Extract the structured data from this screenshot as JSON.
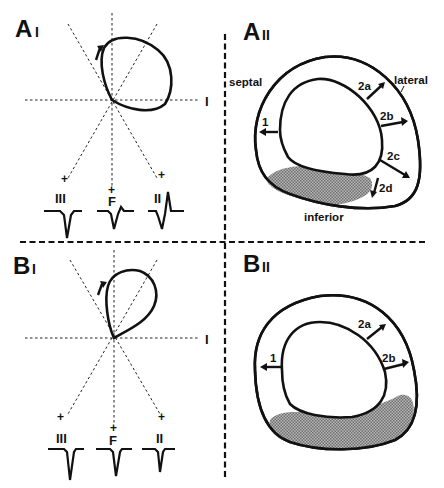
{
  "figure": {
    "panels": {
      "A1": {
        "label": "A",
        "sublabel": "I",
        "axis_label": "I",
        "leads": [
          {
            "name": "III",
            "polarity": "+",
            "waveform": "QS (deep negative)"
          },
          {
            "name": "F",
            "polarity": "+",
            "waveform": "Q with small r"
          },
          {
            "name": "II",
            "polarity": "+",
            "waveform": "Q followed by R"
          }
        ],
        "loop": "clockwise vector loop, superior-right"
      },
      "A2": {
        "label": "A",
        "sublabel": "II",
        "regions": {
          "septal": "septal",
          "lateral": "lateral",
          "inferior": "inferior"
        },
        "vectors": [
          "1",
          "2a",
          "2b",
          "2c",
          "2d"
        ]
      },
      "B1": {
        "label": "B",
        "sublabel": "I",
        "axis_label": "I",
        "leads": [
          {
            "name": "III",
            "polarity": "+",
            "waveform": "QS"
          },
          {
            "name": "F",
            "polarity": "+",
            "waveform": "QS"
          },
          {
            "name": "II",
            "polarity": "+",
            "waveform": "QS"
          }
        ],
        "loop": "clockwise superior loop (shaded)"
      },
      "B2": {
        "label": "B",
        "sublabel": "II",
        "vectors": [
          "1",
          "2a",
          "2b"
        ]
      }
    },
    "colors": {
      "ink": "#111111",
      "shading": "#8a8a8a",
      "background": "#ffffff"
    }
  }
}
